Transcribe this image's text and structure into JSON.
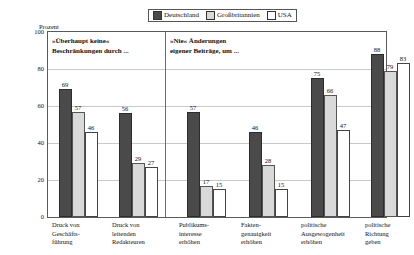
{
  "axis": {
    "ylabel": "Prozent",
    "ticks": [
      100,
      80,
      60,
      40,
      20,
      0
    ]
  },
  "legend": {
    "items": [
      {
        "label": "Deutschland",
        "color": "#4a4a4a",
        "icon": "legend-swatch-filled"
      },
      {
        "label": "Großbritannien",
        "color": "#d9d9d9",
        "icon": "legend-swatch-light"
      },
      {
        "label": "USA",
        "color": "#ffffff",
        "icon": "legend-swatch-empty"
      }
    ]
  },
  "sections": [
    {
      "line1": "»Überhaupt keine«",
      "line2": "Beschränkungen durch ..."
    },
    {
      "line1": "»Nie« Änderungen",
      "line2": "eigener Beiträge, um ..."
    }
  ],
  "categories": [
    {
      "line1": "Druck von",
      "line2": "Geschäfts-",
      "line3": "führung"
    },
    {
      "line1": "Druck von",
      "line2": "leitenden",
      "line3": "Redakteuren"
    },
    {
      "line1": "Publikums-",
      "line2": "interesse",
      "line3": "erhöhen"
    },
    {
      "line1": "Fakten-",
      "line2": "genauigkeit",
      "line3": "erhöhen"
    },
    {
      "line1": "politische",
      "line2": "Ausgewogenheit",
      "line3": "erhöhen"
    },
    {
      "line1": "politische",
      "line2": "Richtung",
      "line3": "geben"
    }
  ],
  "values": {
    "g0": {
      "de": "69",
      "gb": "57",
      "us": "46"
    },
    "g1": {
      "de": "56",
      "gb": "29",
      "us": "27"
    },
    "g2": {
      "de": "57",
      "gb": "17",
      "us": "15"
    },
    "g3": {
      "de": "46",
      "gb": "28",
      "us": "15"
    },
    "g4": {
      "de": "75",
      "gb": "66",
      "us": "47"
    },
    "g5": {
      "de": "88",
      "gb": "79",
      "us": "83"
    }
  },
  "tick_labels": {
    "t0": "100",
    "t1": "80",
    "t2": "60",
    "t3": "40",
    "t4": "20",
    "t5": "0"
  },
  "chart_data": {
    "type": "bar",
    "title": "",
    "subtitle": "",
    "xlabel": "",
    "ylabel": "Prozent",
    "ylim": [
      0,
      100
    ],
    "grid": true,
    "legend_position": "top-center",
    "categories": [
      "Druck von Geschäftsführung",
      "Druck von leitenden Redakteuren",
      "Publikumsinteresse erhöhen",
      "Faktengenauigkeit erhöhen",
      "politische Ausgewogenheit erhöhen",
      "politische Richtung geben"
    ],
    "series": [
      {
        "name": "Deutschland",
        "values": [
          69,
          56,
          57,
          46,
          75,
          88
        ],
        "color": "#4a4a4a"
      },
      {
        "name": "Großbritannien",
        "values": [
          57,
          29,
          17,
          28,
          66,
          79
        ],
        "color": "#d9d9d9"
      },
      {
        "name": "USA",
        "values": [
          46,
          27,
          15,
          15,
          47,
          83
        ],
        "color": "#ffffff"
      }
    ],
    "annotations": [
      "»Überhaupt keine« Beschränkungen durch ...",
      "»Nie« Änderungen eigener Beiträge, um ..."
    ],
    "yticks": [
      0,
      20,
      40,
      60,
      80,
      100
    ]
  }
}
